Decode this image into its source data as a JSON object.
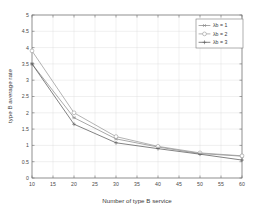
{
  "chart_data": {
    "type": "line",
    "title": "",
    "xlabel": "Number of type B service",
    "ylabel": "type B average rate",
    "x": [
      10,
      20,
      30,
      40,
      50,
      60
    ],
    "xlim": [
      10,
      60
    ],
    "ylim": [
      0,
      5
    ],
    "xticks": [
      10,
      15,
      20,
      25,
      30,
      35,
      40,
      45,
      50,
      55,
      60
    ],
    "xtick_labels": [
      "10",
      "15",
      "20",
      "25",
      "30",
      "35",
      "40",
      "45",
      "50",
      "55",
      "60"
    ],
    "yticks": [
      0,
      0.5,
      1,
      1.5,
      2,
      2.5,
      3,
      3.5,
      4,
      4.5,
      5
    ],
    "ytick_labels": [
      "0",
      "0.5",
      "1",
      "1.5",
      "2",
      "2.5",
      "3",
      "3.5",
      "4",
      "4.5",
      "5"
    ],
    "grid": true,
    "legend_position": "top-right",
    "series": [
      {
        "name": "λb = 1",
        "marker": "asterisk",
        "color": "#8c8c8c",
        "values": [
          3.5,
          1.85,
          1.2,
          0.95,
          0.75,
          0.67
        ]
      },
      {
        "name": "λb = 2",
        "marker": "circle",
        "color": "#9a9a9a",
        "values": [
          3.9,
          2.0,
          1.27,
          0.97,
          0.77,
          0.68
        ]
      },
      {
        "name": "λb = 3",
        "marker": "plus",
        "color": "#5a5a5a",
        "values": [
          3.5,
          1.65,
          1.08,
          0.9,
          0.73,
          0.55
        ]
      }
    ]
  },
  "legend": {
    "entries": [
      "λb = 1",
      "λb = 2",
      "λb = 3"
    ]
  },
  "axes": {
    "x_title": "Number of type B service",
    "y_title": "type B average rate"
  }
}
